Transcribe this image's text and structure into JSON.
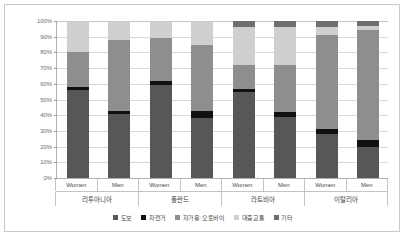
{
  "chart_data": {
    "type": "bar",
    "subtype": "stacked-percentage",
    "title": "",
    "xlabel": "",
    "ylabel": "",
    "ylim": [
      0,
      100
    ],
    "ytick_labels": [
      "100%",
      "90%",
      "80%",
      "70%",
      "60%",
      "50%",
      "40%",
      "30%",
      "20%",
      "10%",
      "0%"
    ],
    "ytick_values": [
      100,
      90,
      80,
      70,
      60,
      50,
      40,
      30,
      20,
      10,
      0
    ],
    "grid": true,
    "legend_position": "bottom",
    "groups": [
      "리투아니아",
      "폴란드",
      "라트비아",
      "이탈리아"
    ],
    "subcategories": [
      "Women",
      "Men"
    ],
    "categories": [
      "리투아니아 Women",
      "리투아니아 Men",
      "폴란드 Women",
      "폴란드 Men",
      "라트비아 Women",
      "라트비아 Men",
      "이탈리아 Women",
      "이탈리아 Men"
    ],
    "series": [
      {
        "name": "도보",
        "color": "#575757",
        "values": [
          56,
          41,
          59,
          38,
          55,
          39,
          28,
          20
        ]
      },
      {
        "name": "자전거",
        "color": "#111111",
        "values": [
          2,
          2,
          3,
          5,
          2,
          3,
          3,
          4
        ]
      },
      {
        "name": "자가용·오토바이",
        "color": "#8e8e8e",
        "values": [
          22,
          45,
          27,
          42,
          15,
          30,
          60,
          70
        ]
      },
      {
        "name": "대중교통",
        "color": "#cfcfcf",
        "values": [
          20,
          12,
          11,
          15,
          24,
          24,
          5,
          3
        ]
      },
      {
        "name": "기타",
        "color": "#6e6e6e",
        "values": [
          0,
          0,
          0,
          0,
          4,
          4,
          4,
          3
        ]
      }
    ]
  },
  "legend": {
    "items": [
      {
        "label": "도보",
        "color": "#575757"
      },
      {
        "label": "자전거",
        "color": "#111111"
      },
      {
        "label": "자가용·오토바이",
        "color": "#8e8e8e"
      },
      {
        "label": "대중교통",
        "color": "#cfcfcf"
      },
      {
        "label": "기타",
        "color": "#6e6e6e"
      }
    ]
  },
  "axis": {
    "x_cells": [
      "Women",
      "Men",
      "Women",
      "Men",
      "Women",
      "Men",
      "Women",
      "Men"
    ],
    "group_cells": [
      "리투아니아",
      "폴란드",
      "라트비아",
      "이탈리아"
    ]
  }
}
